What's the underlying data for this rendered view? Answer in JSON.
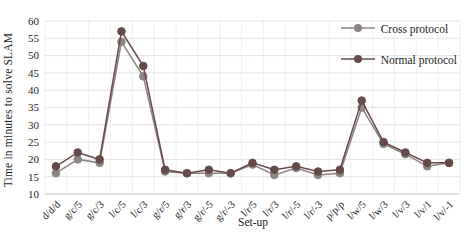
{
  "chart_data": {
    "type": "line",
    "title": "",
    "xlabel": "Set-up",
    "ylabel": "Time in minutes to solve SLAM",
    "ylim": [
      10,
      60
    ],
    "ytick_step": 5,
    "grid": "light horizontal and faint vertical gridlines",
    "legend_position": "top-right inside plot, transparent",
    "categories": [
      "d/d/d",
      "g/c/5",
      "g/c/3",
      "l/c/5",
      "l/c/3",
      "g/r/5",
      "g/r/3",
      "g/r/-5",
      "g/r/-3",
      "l/r/5",
      "l/r/3",
      "l/r/-5",
      "l/r/-3",
      "p/p/p",
      "l/w/5",
      "l/w/3",
      "l/v/3",
      "l/v/1",
      "l/v/-1"
    ],
    "series": [
      {
        "name": "Cross protocol",
        "color": "#8d8583",
        "values": [
          16,
          20,
          19,
          54,
          44,
          16.5,
          16,
          16,
          16,
          18.5,
          15.5,
          17.5,
          15.5,
          16,
          35,
          24.5,
          21.5,
          18,
          19
        ]
      },
      {
        "name": "Normal protocol",
        "color": "#654a49",
        "values": [
          18,
          22,
          20,
          57,
          47,
          17,
          16,
          17,
          16,
          19,
          17,
          18,
          16.5,
          17,
          37,
          25,
          22,
          19,
          19
        ]
      }
    ],
    "colors": {
      "h_gridline": "#e4e4e4",
      "v_gridline": "#efefef",
      "axis_line": "#c2c2c2",
      "tick_text": "#1c1c1c"
    }
  }
}
